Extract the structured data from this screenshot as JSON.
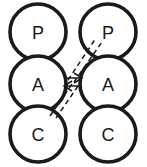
{
  "diagram": {
    "canvas": {
      "width": 147,
      "height": 167,
      "background": "#ffffff"
    },
    "style": {
      "node_fill": "#ffffff",
      "node_stroke": "#1a1a1a",
      "node_stroke_width": 3.6,
      "link_stroke": "#1a1a1a",
      "link_stroke_width": 1.5,
      "label_color": "#1a1a1a",
      "label_font_size": 18
    },
    "columns": [
      {
        "name": "left-agent",
        "center_x": 38,
        "nodes": [
          {
            "id": "left-presentation",
            "label": "P",
            "cx": 38,
            "cy": 32,
            "r": 28
          },
          {
            "id": "left-abstraction",
            "label": "A",
            "cx": 38,
            "cy": 84,
            "r": 28
          },
          {
            "id": "left-control",
            "label": "C",
            "cx": 38,
            "cy": 134,
            "r": 28
          }
        ]
      },
      {
        "name": "right-agent",
        "center_x": 108,
        "nodes": [
          {
            "id": "right-presentation",
            "label": "P",
            "cx": 108,
            "cy": 32,
            "r": 28
          },
          {
            "id": "right-abstraction",
            "label": "A",
            "cx": 108,
            "cy": 84,
            "r": 28
          },
          {
            "id": "right-control",
            "label": "C",
            "cx": 108,
            "cy": 134,
            "r": 28
          }
        ]
      }
    ],
    "links": [
      {
        "id": "a-to-a-upper",
        "from": "left-abstraction",
        "to": "right-abstraction",
        "style": "solid",
        "x1": 66,
        "y1": 78,
        "x2": 80,
        "y2": 78
      },
      {
        "id": "a-to-a-lower",
        "from": "right-abstraction",
        "to": "left-abstraction",
        "style": "solid",
        "x1": 80,
        "y1": 86,
        "x2": 66,
        "y2": 86
      },
      {
        "id": "left-a-to-right-p-outer",
        "from": "left-abstraction",
        "to": "right-presentation",
        "style": "dashed",
        "x1": 68,
        "y1": 80,
        "x2": 96,
        "y2": 38
      },
      {
        "id": "left-a-to-right-p-inner",
        "from": "left-abstraction",
        "to": "right-presentation",
        "style": "dashed",
        "x1": 74,
        "y1": 82,
        "x2": 102,
        "y2": 42
      },
      {
        "id": "left-a-to-left-c-outer",
        "from": "right-abstraction",
        "to": "left-control",
        "style": "dashed",
        "x1": 78,
        "y1": 86,
        "x2": 56,
        "y2": 118
      },
      {
        "id": "left-a-to-left-c-inner",
        "from": "right-abstraction",
        "to": "left-control",
        "style": "dashed",
        "x1": 72,
        "y1": 84,
        "x2": 50,
        "y2": 116
      }
    ],
    "arrowheads": [
      {
        "id": "arrow-into-left-a",
        "points": "74,80 66,82 73,86"
      },
      {
        "id": "arrow-into-right-a",
        "points": "72,74 80,78 72,82"
      }
    ]
  }
}
